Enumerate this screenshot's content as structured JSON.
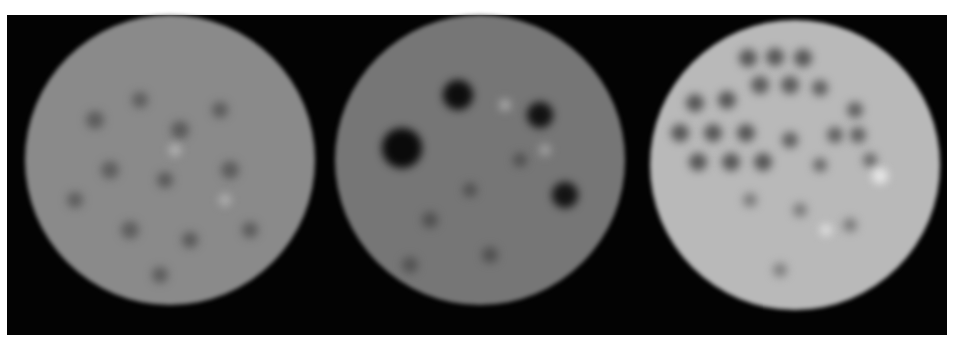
{
  "figure": {
    "background": "#030303",
    "panels": [
      {
        "id": "phantom-1",
        "cx": 170,
        "cy": 160,
        "r": 145,
        "base": "#8a8a8a",
        "edge": "#5a5a5a",
        "spots": [
          {
            "x": 95,
            "y": 120,
            "r": 9,
            "c": "#5c5c5c"
          },
          {
            "x": 140,
            "y": 100,
            "r": 8,
            "c": "#5e5e5e"
          },
          {
            "x": 180,
            "y": 130,
            "r": 9,
            "c": "#5a5a5a"
          },
          {
            "x": 220,
            "y": 110,
            "r": 8,
            "c": "#5c5c5c"
          },
          {
            "x": 110,
            "y": 170,
            "r": 9,
            "c": "#5e5e5e"
          },
          {
            "x": 165,
            "y": 180,
            "r": 8,
            "c": "#5a5a5a"
          },
          {
            "x": 230,
            "y": 170,
            "r": 9,
            "c": "#5c5c5c"
          },
          {
            "x": 130,
            "y": 230,
            "r": 9,
            "c": "#5e5e5e"
          },
          {
            "x": 190,
            "y": 240,
            "r": 8,
            "c": "#5a5a5a"
          },
          {
            "x": 250,
            "y": 230,
            "r": 8,
            "c": "#5c5c5c"
          },
          {
            "x": 175,
            "y": 150,
            "r": 6,
            "c": "#b5b5b5"
          },
          {
            "x": 225,
            "y": 200,
            "r": 6,
            "c": "#b0b0b0"
          },
          {
            "x": 75,
            "y": 200,
            "r": 8,
            "c": "#5e5e5e"
          },
          {
            "x": 160,
            "y": 275,
            "r": 8,
            "c": "#5c5c5c"
          }
        ]
      },
      {
        "id": "phantom-2",
        "cx": 480,
        "cy": 160,
        "r": 145,
        "base": "#767676",
        "edge": "#4a4a4a",
        "spots": [
          {
            "x": 402,
            "y": 148,
            "r": 20,
            "c": "#0a0a0a"
          },
          {
            "x": 458,
            "y": 95,
            "r": 15,
            "c": "#0d0d0d"
          },
          {
            "x": 540,
            "y": 115,
            "r": 13,
            "c": "#121212"
          },
          {
            "x": 565,
            "y": 195,
            "r": 13,
            "c": "#141414"
          },
          {
            "x": 430,
            "y": 220,
            "r": 8,
            "c": "#505050"
          },
          {
            "x": 490,
            "y": 255,
            "r": 8,
            "c": "#505050"
          },
          {
            "x": 520,
            "y": 160,
            "r": 7,
            "c": "#505050"
          },
          {
            "x": 470,
            "y": 190,
            "r": 7,
            "c": "#505050"
          },
          {
            "x": 505,
            "y": 105,
            "r": 6,
            "c": "#a8a8a8"
          },
          {
            "x": 545,
            "y": 150,
            "r": 6,
            "c": "#a0a0a0"
          },
          {
            "x": 410,
            "y": 265,
            "r": 8,
            "c": "#525252"
          }
        ]
      },
      {
        "id": "phantom-3",
        "cx": 795,
        "cy": 165,
        "r": 145,
        "base": "#b9b9b9",
        "edge": "#7a7a7a",
        "spots": [
          {
            "x": 748,
            "y": 58,
            "r": 9,
            "c": "#555555"
          },
          {
            "x": 775,
            "y": 57,
            "r": 9,
            "c": "#555555"
          },
          {
            "x": 803,
            "y": 58,
            "r": 9,
            "c": "#555555"
          },
          {
            "x": 760,
            "y": 85,
            "r": 9,
            "c": "#5a5a5a"
          },
          {
            "x": 790,
            "y": 85,
            "r": 9,
            "c": "#5a5a5a"
          },
          {
            "x": 820,
            "y": 88,
            "r": 8,
            "c": "#5e5e5e"
          },
          {
            "x": 695,
            "y": 103,
            "r": 9,
            "c": "#555555"
          },
          {
            "x": 727,
            "y": 100,
            "r": 9,
            "c": "#555555"
          },
          {
            "x": 855,
            "y": 110,
            "r": 8,
            "c": "#606060"
          },
          {
            "x": 680,
            "y": 133,
            "r": 9,
            "c": "#555555"
          },
          {
            "x": 713,
            "y": 133,
            "r": 9,
            "c": "#555555"
          },
          {
            "x": 746,
            "y": 133,
            "r": 9,
            "c": "#555555"
          },
          {
            "x": 790,
            "y": 140,
            "r": 8,
            "c": "#5e5e5e"
          },
          {
            "x": 858,
            "y": 135,
            "r": 8,
            "c": "#606060"
          },
          {
            "x": 698,
            "y": 162,
            "r": 9,
            "c": "#555555"
          },
          {
            "x": 731,
            "y": 162,
            "r": 9,
            "c": "#555555"
          },
          {
            "x": 763,
            "y": 162,
            "r": 9,
            "c": "#555555"
          },
          {
            "x": 835,
            "y": 135,
            "r": 8,
            "c": "#606060"
          },
          {
            "x": 870,
            "y": 160,
            "r": 7,
            "c": "#666666"
          },
          {
            "x": 820,
            "y": 165,
            "r": 7,
            "c": "#666666"
          },
          {
            "x": 800,
            "y": 210,
            "r": 7,
            "c": "#7a7a7a"
          },
          {
            "x": 750,
            "y": 200,
            "r": 7,
            "c": "#7a7a7a"
          },
          {
            "x": 850,
            "y": 225,
            "r": 7,
            "c": "#7a7a7a"
          },
          {
            "x": 780,
            "y": 270,
            "r": 7,
            "c": "#7e7e7e"
          },
          {
            "x": 880,
            "y": 176,
            "r": 8,
            "c": "#e8e8e8"
          },
          {
            "x": 826,
            "y": 230,
            "r": 6,
            "c": "#e0e0e0"
          }
        ]
      }
    ]
  }
}
